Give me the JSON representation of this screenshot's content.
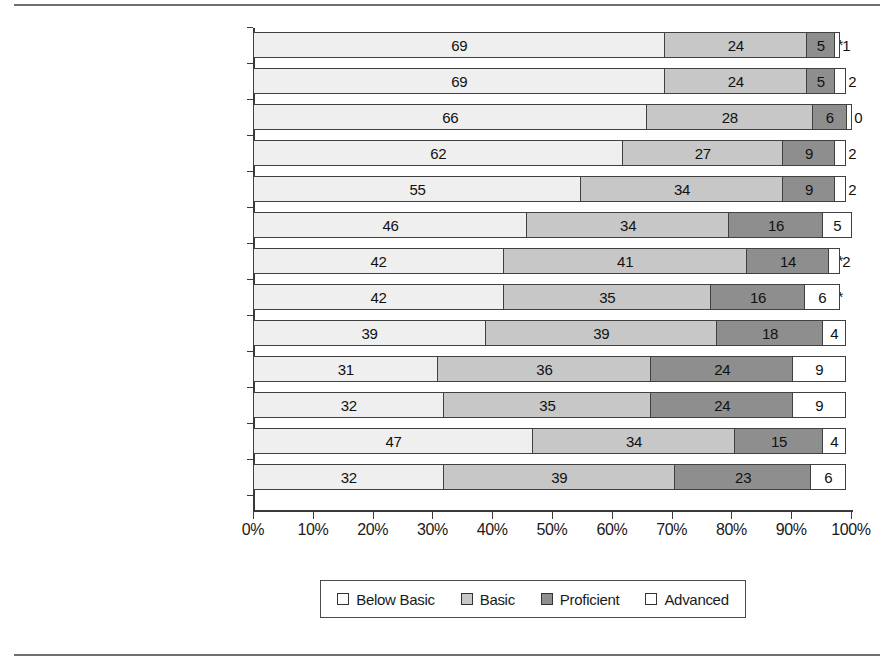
{
  "chart_data": {
    "type": "bar",
    "orientation": "horizontal",
    "stacked": true,
    "stacked_percent": true,
    "title": "",
    "xlabel": "",
    "ylabel": "",
    "xlim": [
      0,
      100
    ],
    "grid": false,
    "legend_position": "bottom",
    "categories": [
      "Atlanta (245) *,**",
      "District of Columbia (245) *,**",
      "Cleveland (249) *,**",
      "Los Angeles (250) *,**",
      "Chicago (258) *,**",
      "New York City (267) **",
      "Houston (267) **",
      "Boston (270) *,**",
      "San Diego (270) *,**",
      "Charlotte (281) *,**",
      "Austin (281) *,**",
      "Large Central City (265) **",
      "Nation (278) *"
    ],
    "series": [
      {
        "name": "Below Basic",
        "color": "#efefef",
        "values": [
          69,
          69,
          66,
          62,
          55,
          46,
          42,
          42,
          39,
          31,
          32,
          47,
          32
        ]
      },
      {
        "name": "Basic",
        "color": "#c7c7c7",
        "values": [
          24,
          24,
          28,
          27,
          34,
          34,
          41,
          35,
          39,
          36,
          35,
          34,
          39
        ]
      },
      {
        "name": "Proficient",
        "color": "#8e8e8e",
        "values": [
          5,
          5,
          6,
          9,
          9,
          16,
          14,
          16,
          18,
          24,
          24,
          15,
          23
        ]
      },
      {
        "name": "Advanced",
        "color": "#ffffff",
        "values": [
          1,
          2,
          0,
          2,
          2,
          5,
          2,
          6,
          4,
          9,
          9,
          4,
          6
        ]
      }
    ],
    "xticks": [
      0,
      10,
      20,
      30,
      40,
      50,
      60,
      70,
      80,
      90,
      100
    ],
    "xticklabels": [
      "0%",
      "10%",
      "20%",
      "30%",
      "40%",
      "50%",
      "60%",
      "70%",
      "80%",
      "90%",
      "100%"
    ]
  },
  "legend": {
    "items": [
      {
        "label": "Below Basic",
        "swatch": "sw-below"
      },
      {
        "label": "Basic",
        "swatch": "sw-basic"
      },
      {
        "label": "Proficient",
        "swatch": "sw-prof"
      },
      {
        "label": "Advanced",
        "swatch": "sw-adv"
      }
    ]
  }
}
